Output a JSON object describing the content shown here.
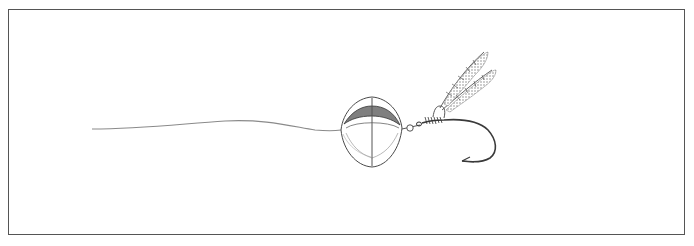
{
  "figure": {
    "components": [
      {
        "name": "fishing-line",
        "description": "thin wavy line from left leading to the lure"
      },
      {
        "name": "spinner-blade",
        "description": "round shaded blade with center seam"
      },
      {
        "name": "bead",
        "description": "small round bead behind the blade"
      },
      {
        "name": "hook",
        "description": "curved hook with barb"
      },
      {
        "name": "feather-dressing",
        "description": "two feathers tied at the hook eye"
      }
    ],
    "colors": {
      "frame": "#555555",
      "pencil": "#3a3a3a",
      "shade": "#888888",
      "background": "#ffffff"
    }
  }
}
